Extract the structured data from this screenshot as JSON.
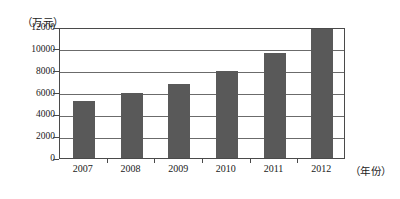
{
  "chart_data": {
    "type": "bar",
    "title": "",
    "subtitle": "",
    "xlabel": "（年份）",
    "ylabel": "（万元）",
    "categories": [
      "2007",
      "2008",
      "2009",
      "2010",
      "2011",
      "2012"
    ],
    "values": [
      5200,
      6000,
      6800,
      8000,
      9650,
      11850
    ],
    "series": [
      {
        "name": "",
        "values": [
          5200,
          6000,
          6800,
          8000,
          9650,
          11850
        ]
      }
    ],
    "ylim": [
      0,
      12000
    ],
    "ytick_labels": [
      "12000",
      "10000",
      "8000",
      "6000",
      "4000",
      "2000",
      "0"
    ],
    "ytick_values": [
      12000,
      10000,
      8000,
      6000,
      4000,
      2000,
      0
    ],
    "grid": true,
    "grid_axis": "y",
    "legend": false,
    "legend_position": "none",
    "bar_color": "#595959",
    "axis_color": "#4a4a4a",
    "grid_color": "#6b6b6b",
    "background": "#ffffff",
    "annotations": []
  }
}
